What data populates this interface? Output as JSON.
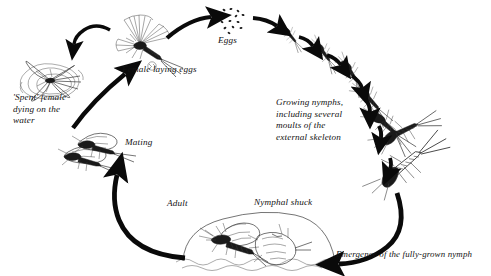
{
  "diagram": {
    "type": "cyclic-life-cycle-diagram",
    "direction": "clockwise",
    "ink_color": "#1a1a1a",
    "background_color": "#ffffff"
  },
  "labels": {
    "spent_female": "'Spent' female\ndying on the\nwater",
    "female_laying_eggs": "Female laying eggs",
    "eggs": "Eggs",
    "growing_nymphs": "Growing nymphs,\nincluding several\nmoults of the\nexternal skeleton",
    "emergence": "Emergence of the fully-grown nymph",
    "nymphal_shuck": "Nymphal shuck",
    "adult": "Adult",
    "mating": "Mating"
  },
  "stages": [
    {
      "key": "female_laying_eggs",
      "label": "Female laying eggs",
      "order": 1
    },
    {
      "key": "eggs",
      "label": "Eggs",
      "order": 2
    },
    {
      "key": "growing_nymphs",
      "label": "Growing nymphs, including several moults of the external skeleton",
      "order": 3
    },
    {
      "key": "emergence",
      "label": "Emergence of the fully-grown nymph",
      "order": 4
    },
    {
      "key": "nymphal_shuck",
      "label": "Nymphal shuck",
      "order": 5
    },
    {
      "key": "adult",
      "label": "Adult",
      "order": 6
    },
    {
      "key": "mating",
      "label": "Mating",
      "order": 7
    },
    {
      "key": "spent_female",
      "label": "'Spent' female dying on the water",
      "order": 8
    }
  ],
  "nymph_count": 7,
  "egg_count": 14
}
